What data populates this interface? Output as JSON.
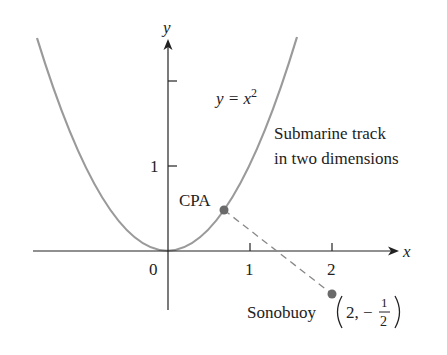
{
  "figure": {
    "axes": {
      "x_label": "x",
      "y_label": "y",
      "x_ticks": [
        {
          "value": 0,
          "label": "0"
        },
        {
          "value": 1,
          "label": "1"
        },
        {
          "value": 2,
          "label": "2"
        }
      ],
      "y_ticks": [
        {
          "value": 1,
          "label": "1"
        },
        {
          "value": 2,
          "label": ""
        }
      ]
    },
    "curve": {
      "equation_lhs": "y = x",
      "equation_exp": "2",
      "color": "#9a9a9a"
    },
    "track_label": {
      "line1": "Submarine track",
      "line2": "in two dimensions"
    },
    "points": {
      "cpa": {
        "label": "CPA",
        "x": 0.69,
        "y": 0.48,
        "color": "#6a6a6a"
      },
      "sonobuoy": {
        "label": "Sonobuoy",
        "coord_prefix": "2, −",
        "frac_num": "1",
        "frac_den": "2",
        "x": 2,
        "y": -0.5,
        "color": "#6a6a6a"
      }
    },
    "connector": {
      "style": "dashed",
      "color": "#888888"
    }
  }
}
